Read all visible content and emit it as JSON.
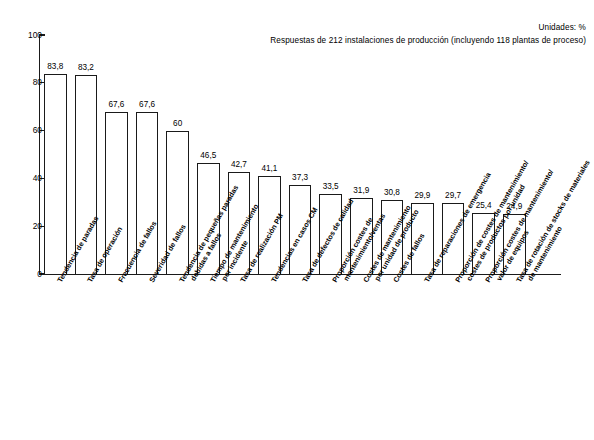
{
  "header": {
    "units_note": "Unidades: %",
    "sample_note": "Respuestas de 212 instalaciones de producción (incluyendo 118 plantas de proceso)"
  },
  "chart_data": {
    "type": "bar",
    "title": "",
    "subtitle": "Respuestas de 212 instalaciones de producción (incluyendo 118 plantas de proceso)",
    "xlabel": "",
    "ylabel": "",
    "units": "%",
    "ylim": [
      0,
      100
    ],
    "yticks": [
      0,
      20,
      40,
      60,
      80,
      100
    ],
    "ytick_labels": [
      "0",
      "20",
      "40",
      "60",
      "80",
      "100"
    ],
    "grid": false,
    "legend": "none",
    "categories": [
      "Tendencia de paradas",
      "Tasa de operación",
      "Frecuencia de fallos",
      "Severidad de fallos",
      "Tendencia de pequeñas paradas debidas a fallos",
      "Tiempo de mantenimiento por incidente",
      "Tasa de realización PM",
      "Tendencias en casos CM",
      "Tasa de defectos de calidad",
      "Proporción costes de mantenimiento/ventas",
      "Costes de mantenimiento por unidad de producto",
      "Costes de fallos",
      "Tasa de reparaciones de emergencia",
      "Proporción de costes de mantenimiento/costes de productos por unidad",
      "Proporción costes de mantenimiento/valor de equipos",
      "Tasa de rotación de stocks de materiales de mantenimiento"
    ],
    "category_lines": [
      [
        "Tendencia de paradas"
      ],
      [
        "Tasa de operación"
      ],
      [
        "Frecuencia de fallos"
      ],
      [
        "Severidad de fallos"
      ],
      [
        "Tendencia de pequeñas paradas",
        "debidas a fallos"
      ],
      [
        "Tiempo de mantenimiento",
        "por incidente"
      ],
      [
        "Tasa de realización PM"
      ],
      [
        "Tendencias en casos CM"
      ],
      [
        "Tasa de defectos de calidad"
      ],
      [
        "Proporción costes de",
        "mantenimiento/ventas"
      ],
      [
        "Costes de mantenimiento",
        "por unidad de producto"
      ],
      [
        "Costes de fallos"
      ],
      [
        "Tasa de reparaciones de emergencia"
      ],
      [
        "Proporción de costes de mantenimiento/",
        "costes de productos por unidad"
      ],
      [
        "Proporción costes de mantenimiento/",
        "valor de equipos"
      ],
      [
        "Tasa de rotación de stocks de materiales",
        "de mantenimiento"
      ]
    ],
    "values": [
      83.8,
      83.2,
      67.6,
      67.6,
      60,
      46.5,
      42.7,
      41.1,
      37.3,
      33.5,
      31.9,
      30.8,
      29.9,
      29.7,
      25.4,
      24.9
    ],
    "value_labels": [
      "83,8",
      "83,2",
      "67,6",
      "67,6",
      "60",
      "46,5",
      "42,7",
      "41,1",
      "37,3",
      "33,5",
      "31,9",
      "30,8",
      "29,9",
      "29,7",
      "25,4",
      "24,9"
    ]
  }
}
